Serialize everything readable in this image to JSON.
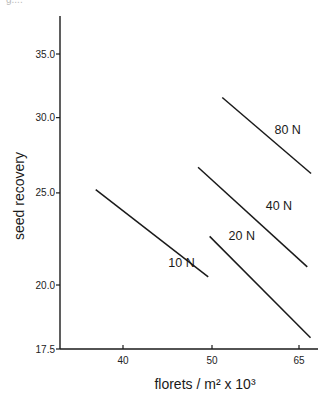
{
  "header_fragment": "g....",
  "chart_data": {
    "type": "line",
    "title": "",
    "xlabel": "florets / m² x 10³",
    "ylabel": "seed  recovery",
    "x_scale": "log",
    "y_scale": "log",
    "xlim": [
      34,
      68
    ],
    "ylim": [
      17.5,
      38
    ],
    "x_ticks": [
      40,
      50,
      65
    ],
    "x_tick_labels": [
      "40",
      "50",
      "65"
    ],
    "y_ticks": [
      17.5,
      20.0,
      25.0,
      30.0,
      35.0
    ],
    "y_tick_labels": [
      "17.5",
      "20.0",
      "25.0",
      "30.0",
      "35.0"
    ],
    "grid": false,
    "legend": "inline labels",
    "series": [
      {
        "name": "10 N",
        "x": [
          37.1,
          50.6
        ],
        "y": [
          25.2,
          20.4
        ],
        "label_pos": [
          47.0,
          20.9
        ]
      },
      {
        "name": "20 N",
        "x": [
          50.8,
          67.1
        ],
        "y": [
          22.5,
          17.6
        ],
        "label_pos": [
          55.5,
          22.3
        ]
      },
      {
        "name": "40 N",
        "x": [
          49.2,
          66.5
        ],
        "y": [
          26.6,
          20.9
        ],
        "label_pos": [
          61.5,
          24.0
        ]
      },
      {
        "name": "80 N",
        "x": [
          52.6,
          67.2
        ],
        "y": [
          31.5,
          26.2
        ],
        "label_pos": [
          63.0,
          28.8
        ]
      }
    ]
  }
}
